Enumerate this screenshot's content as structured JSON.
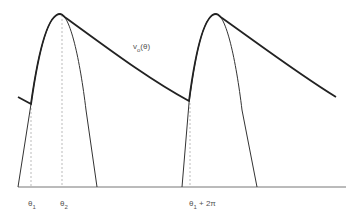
{
  "diagram": {
    "title": "",
    "curve_label": {
      "base": "v",
      "sub": "o",
      "suffix": "(θ)"
    },
    "axis_labels": [
      {
        "id": "theta1",
        "base": "θ",
        "sub": "1",
        "suffix": ""
      },
      {
        "id": "theta2",
        "base": "θ",
        "sub": "2",
        "suffix": ""
      },
      {
        "id": "theta1_2pi",
        "base": "θ",
        "sub": "1",
        "suffix": " + 2π"
      }
    ],
    "colors": {
      "curve": "#222222",
      "dashed": "#aaaaaa",
      "axis": "#777777"
    }
  }
}
